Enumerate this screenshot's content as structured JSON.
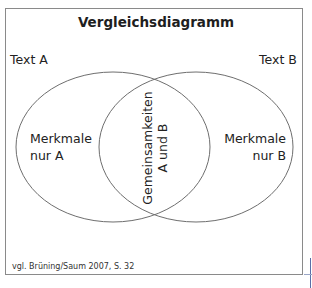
{
  "diagram": {
    "title": "Vergleichsdiagramm",
    "set_a": {
      "name": "Text A",
      "unique_label_line1": "Merkmale",
      "unique_label_line2": "nur A"
    },
    "set_b": {
      "name": "Text B",
      "unique_label_line1": "Merkmale",
      "unique_label_line2": "nur B"
    },
    "intersection": {
      "line1": "Gemeinsamkeiten",
      "line2": "A und B"
    },
    "source": "vgl. Brüning/Saum 2007, S. 32",
    "colors": {
      "stroke": "#6e6e6e",
      "frame": "#8a8a8a",
      "text": "#222222"
    }
  }
}
